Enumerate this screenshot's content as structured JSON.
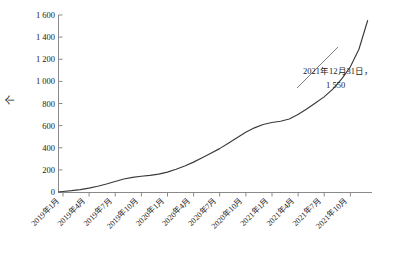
{
  "chart_data": {
    "type": "line",
    "title": "",
    "subtitle": "",
    "xlabel": "",
    "ylabel": "个",
    "ylabel_rotation": "vertical-ccw",
    "ylim": [
      0,
      1600
    ],
    "ytick_values": [
      0,
      200,
      400,
      600,
      800,
      1000,
      1200,
      1400,
      1600
    ],
    "ytick_labels": [
      "0",
      "200",
      "400",
      "600",
      "800",
      "1 000",
      "1 200",
      "1 400",
      "1 600"
    ],
    "grid": false,
    "legend": false,
    "legend_position": "none",
    "xtick_labels": [
      "2019年1月",
      "2019年4月",
      "2019年7月",
      "2019年10月",
      "2020年1月",
      "2020年4月",
      "2020年7月",
      "2020年10月",
      "2021年1月",
      "2021年4月",
      "2021年7月",
      "2021年10月"
    ],
    "x": [
      "2019-01",
      "2019-02",
      "2019-03",
      "2019-04",
      "2019-05",
      "2019-06",
      "2019-07",
      "2019-08",
      "2019-09",
      "2019-10",
      "2019-11",
      "2019-12",
      "2020-01",
      "2020-02",
      "2020-03",
      "2020-04",
      "2020-05",
      "2020-06",
      "2020-07",
      "2020-08",
      "2020-09",
      "2020-10",
      "2020-11",
      "2020-12",
      "2021-01",
      "2021-02",
      "2021-03",
      "2021-04",
      "2021-05",
      "2021-06",
      "2021-07",
      "2021-08",
      "2021-09",
      "2021-10",
      "2021-11",
      "2021-12"
    ],
    "values": [
      5,
      12,
      22,
      35,
      52,
      72,
      95,
      118,
      132,
      142,
      150,
      162,
      180,
      205,
      235,
      270,
      310,
      350,
      392,
      440,
      490,
      540,
      580,
      610,
      628,
      640,
      660,
      700,
      750,
      805,
      860,
      930,
      1020,
      1130,
      1290,
      1550
    ],
    "series": [
      {
        "name": "累计数量",
        "values": [
          5,
          12,
          22,
          35,
          52,
          72,
          95,
          118,
          132,
          142,
          150,
          162,
          180,
          205,
          235,
          270,
          310,
          350,
          392,
          440,
          490,
          540,
          580,
          610,
          628,
          640,
          660,
          700,
          750,
          805,
          860,
          930,
          1020,
          1130,
          1290,
          1550
        ],
        "color": "#3a3a3a"
      }
    ],
    "annotations": [
      {
        "text_line1": "2021年12月31日，",
        "text_line2": "1 550",
        "target_x": "2021-12",
        "target_value": 1550
      }
    ],
    "colors": {
      "line": "#3a3a3a",
      "axis": "#8a8a8a",
      "text": "#1a1a1a",
      "background": "#ffffff"
    }
  }
}
